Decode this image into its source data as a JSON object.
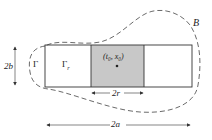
{
  "diagram": {
    "labels": {
      "boundary": "B",
      "gamma": "Γ",
      "gamma_r": "Γ",
      "gamma_r_sub": "r",
      "center_point": "(t₀, x₀)",
      "width_2r": "2r",
      "width_2a": "2a",
      "height_2b": "2b"
    },
    "colors": {
      "shaded_region": "#c8c8c8",
      "stroke": "#333333",
      "background": "#ffffff"
    }
  }
}
